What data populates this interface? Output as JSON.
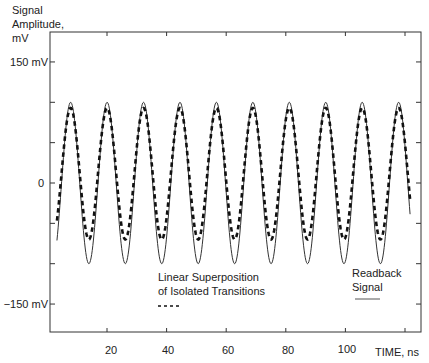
{
  "chart_data": {
    "type": "line",
    "title": "",
    "ylabel": "Signal Amplitude, mV",
    "ylabel_lines": [
      "Signal",
      "Amplitude,",
      "mV"
    ],
    "xlabel": "TIME, ns",
    "xlim": [
      0,
      125.6
    ],
    "ylim": [
      -185,
      188
    ],
    "grid": false,
    "x_ticks": [
      20,
      40,
      60,
      80,
      100,
      120
    ],
    "x_tick_labels": [
      "20",
      "40",
      "60",
      "80",
      "100",
      ""
    ],
    "y_ticks": [
      150,
      100,
      50,
      0,
      -50,
      -100,
      -150
    ],
    "y_tick_labels": [
      {
        "value": 150,
        "label": "150 mV"
      },
      {
        "value": 0,
        "label": "0"
      },
      {
        "value": -150,
        "label": "−150 mV"
      }
    ],
    "legend_position": "inside-bottom",
    "series": [
      {
        "name": "Readback Signal",
        "style": "solid",
        "color": "#333333",
        "t_start": 3.2,
        "t_end": 121.7,
        "period_ns": 12.23,
        "first_peak_ns": 7.8,
        "peak_mV": 100,
        "trough_mV": -100,
        "peak_times_ns": [
          7.8,
          20.0,
          32.3,
          44.5,
          56.7,
          69.0,
          81.2,
          93.4,
          105.6,
          117.9
        ],
        "start_value_mV": -57,
        "end_value_mV": -37
      },
      {
        "name": "Linear Superposition of Isolated Transitions",
        "style": "dashed",
        "color": "#111111",
        "t_start": 3.2,
        "t_end": 121.7,
        "period_ns": 12.23,
        "first_peak_ns": 7.8,
        "peak_mV": 93,
        "trough_mV": -70,
        "peak_times_ns": [
          7.8,
          20.0,
          32.3,
          44.5,
          56.7,
          69.0,
          81.2,
          93.4,
          105.6,
          117.9
        ],
        "start_value_mV": -36,
        "end_value_mV": -27
      }
    ],
    "legend": [
      {
        "lines": [
          "Linear Superposition",
          "of Isolated Transitions"
        ],
        "sample": "- - - -",
        "style": "dashed"
      },
      {
        "lines": [
          "Readback",
          "Signal"
        ],
        "sample": "—",
        "style": "solid"
      }
    ]
  }
}
